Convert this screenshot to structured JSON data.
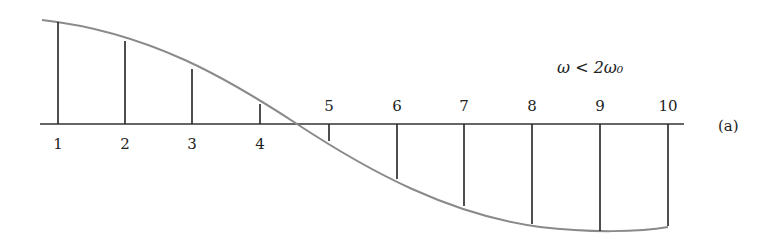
{
  "figure": {
    "condition_label": "ω < 2ω₀",
    "panel_label": "(a)",
    "colors": {
      "curve": "#8a8a8a",
      "stems": "#222222",
      "baseline": "#333333",
      "text": "#222222"
    }
  },
  "chart_data": {
    "type": "stem",
    "title": "",
    "annotation": "ω < 2ω₀",
    "panel": "(a)",
    "x": [
      1,
      2,
      3,
      4,
      5,
      6,
      7,
      8,
      9,
      10
    ],
    "tick_labels": [
      "1",
      "2",
      "3",
      "4",
      "5",
      "6",
      "7",
      "8",
      "9",
      "10"
    ],
    "values": [
      0.98,
      0.8,
      0.52,
      0.17,
      -0.21,
      -0.54,
      -0.79,
      -0.96,
      -1.0,
      -0.97
    ],
    "envelope": "cosine-like curve crossing zero between points 4 and 5",
    "grid": false
  },
  "points": [
    {
      "label": "1",
      "x": 58,
      "top": 22
    },
    {
      "label": "2",
      "x": 125,
      "top": 41
    },
    {
      "label": "3",
      "x": 192,
      "top": 69
    },
    {
      "label": "4",
      "x": 260,
      "top": 104
    },
    {
      "label": "5",
      "x": 329,
      "top": 141
    },
    {
      "label": "6",
      "x": 397,
      "top": 179
    },
    {
      "label": "7",
      "x": 464,
      "top": 206
    },
    {
      "label": "8",
      "x": 532,
      "top": 224
    },
    {
      "label": "9",
      "x": 600,
      "top": 231
    },
    {
      "label": "10",
      "x": 668,
      "top": 226
    }
  ]
}
